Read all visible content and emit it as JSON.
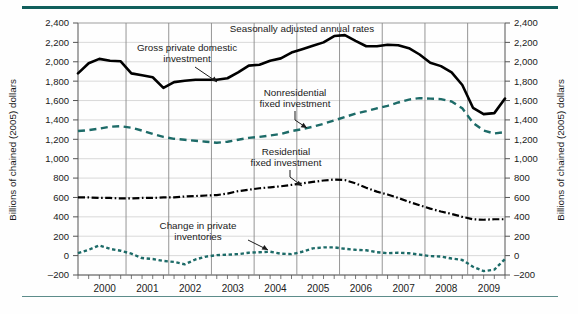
{
  "figure": {
    "header_note": "Seasonally adjusted annual rates",
    "axis_title_left": "Billions of chained (2005) dollars",
    "axis_title_right": "Billions of chained (2005) dollars",
    "rule_color": "#115f5c",
    "series_colors": {
      "gross_private_domestic_investment": "#000000",
      "nonresidential_fixed_investment": "#1d6b68",
      "residential_fixed_investment": "#000000",
      "change_in_private_inventories": "#1d6b68"
    }
  },
  "annotations": [
    {
      "id": "gross",
      "line1": "Gross private domestic",
      "line2": "investment"
    },
    {
      "id": "nonres",
      "line1": "Nonresidential",
      "line2": "fixed investment"
    },
    {
      "id": "res",
      "line1": "Residential",
      "line2": "fixed investment"
    },
    {
      "id": "inventories",
      "line1": "Change in private",
      "line2": "inventories"
    }
  ],
  "chart_data": {
    "type": "line",
    "title": "",
    "subtitle": "Seasonally adjusted annual rates",
    "xlabel": "",
    "ylabel": "Billions of chained (2005) dollars",
    "ylim": [
      -200,
      2400
    ],
    "yticks": [
      -200,
      0,
      200,
      400,
      600,
      800,
      1000,
      1200,
      1400,
      1600,
      1800,
      2000,
      2200,
      2400
    ],
    "ytick_labels": [
      "–200",
      "0",
      "200",
      "400",
      "600",
      "800",
      "1,000",
      "1,200",
      "1,400",
      "1,600",
      "1,800",
      "2,000",
      "2,200",
      "2,400"
    ],
    "grid": true,
    "legend_position": "inline-annotations",
    "x_tick_labels": [
      "2000",
      "2001",
      "2002",
      "2003",
      "2004",
      "2005",
      "2006",
      "2007",
      "2008",
      "2009"
    ],
    "x": [
      "1999Q4",
      "2000Q1",
      "2000Q2",
      "2000Q3",
      "2000Q4",
      "2001Q1",
      "2001Q2",
      "2001Q3",
      "2001Q4",
      "2002Q1",
      "2002Q2",
      "2002Q3",
      "2002Q4",
      "2003Q1",
      "2003Q2",
      "2003Q3",
      "2003Q4",
      "2004Q1",
      "2004Q2",
      "2004Q3",
      "2004Q4",
      "2005Q1",
      "2005Q2",
      "2005Q3",
      "2005Q4",
      "2006Q1",
      "2006Q2",
      "2006Q3",
      "2006Q4",
      "2007Q1",
      "2007Q2",
      "2007Q3",
      "2007Q4",
      "2008Q1",
      "2008Q2",
      "2008Q3",
      "2008Q4",
      "2009Q1",
      "2009Q2",
      "2009Q3",
      "2009Q4"
    ],
    "series": [
      {
        "name": "Gross private domestic investment",
        "style": "solid-thick",
        "color": "#000000",
        "values": [
          1880,
          1985,
          2030,
          2010,
          2005,
          1880,
          1860,
          1840,
          1730,
          1790,
          1805,
          1815,
          1815,
          1815,
          1830,
          1890,
          1960,
          1970,
          2010,
          2035,
          2095,
          2130,
          2165,
          2200,
          2265,
          2275,
          2215,
          2160,
          2160,
          2175,
          2170,
          2140,
          2075,
          1990,
          1955,
          1890,
          1760,
          1525,
          1460,
          1470,
          1620
        ]
      },
      {
        "name": "Nonresidential fixed investment",
        "style": "dashed",
        "color": "#1d6b68",
        "values": [
          1285,
          1295,
          1310,
          1330,
          1335,
          1320,
          1290,
          1255,
          1225,
          1205,
          1195,
          1185,
          1175,
          1165,
          1175,
          1195,
          1215,
          1225,
          1240,
          1255,
          1285,
          1305,
          1330,
          1360,
          1395,
          1430,
          1465,
          1490,
          1520,
          1545,
          1580,
          1610,
          1625,
          1620,
          1615,
          1590,
          1520,
          1370,
          1290,
          1260,
          1275
        ]
      },
      {
        "name": "Residential fixed investment",
        "style": "dash-dot",
        "color": "#000000",
        "values": [
          600,
          600,
          595,
          595,
          590,
          590,
          595,
          595,
          600,
          600,
          610,
          615,
          620,
          625,
          640,
          665,
          680,
          695,
          705,
          715,
          730,
          745,
          760,
          775,
          785,
          780,
          745,
          700,
          660,
          630,
          595,
          555,
          520,
          485,
          455,
          430,
          400,
          375,
          370,
          375,
          375
        ]
      },
      {
        "name": "Change in private inventories",
        "style": "dotted",
        "color": "#1d6b68",
        "values": [
          25,
          60,
          105,
          70,
          50,
          20,
          -25,
          -35,
          -55,
          -65,
          -90,
          -40,
          -10,
          5,
          10,
          15,
          30,
          35,
          40,
          20,
          15,
          40,
          75,
          85,
          85,
          70,
          60,
          55,
          35,
          25,
          30,
          25,
          10,
          -5,
          -10,
          -30,
          -45,
          -115,
          -160,
          -145,
          -35
        ]
      }
    ]
  }
}
